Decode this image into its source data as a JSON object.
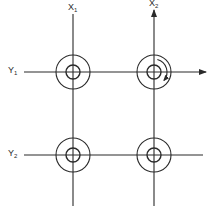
{
  "diagram": {
    "stroke_color": "#2a2a2a",
    "background": "#ffffff",
    "columns": [
      {
        "label": "X",
        "subscript": "1",
        "x": 73,
        "arrow_up": false
      },
      {
        "label": "X",
        "subscript": "2",
        "x": 154,
        "arrow_up": true
      }
    ],
    "rows": [
      {
        "label": "Y",
        "subscript": "1",
        "y": 72,
        "arrow_right": true
      },
      {
        "label": "Y",
        "subscript": "2",
        "y": 155,
        "arrow_right": false
      }
    ],
    "nodes": [
      {
        "id": "node-x1-y1",
        "cx": 73,
        "cy": 72,
        "outer_r": 17,
        "inner_r": 7,
        "rotation_arrow": false
      },
      {
        "id": "node-x2-y1",
        "cx": 154,
        "cy": 72,
        "outer_r": 17,
        "inner_r": 7,
        "rotation_arrow": true,
        "rotation_direction": "clockwise"
      },
      {
        "id": "node-x1-y2",
        "cx": 73,
        "cy": 155,
        "outer_r": 17,
        "inner_r": 7,
        "rotation_arrow": false
      },
      {
        "id": "node-x2-y2",
        "cx": 154,
        "cy": 155,
        "outer_r": 17,
        "inner_r": 7,
        "rotation_arrow": false
      }
    ]
  }
}
